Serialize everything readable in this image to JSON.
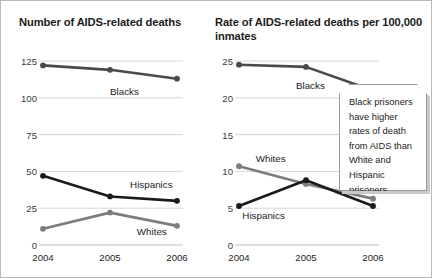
{
  "callout": {
    "text": "Black prisoners have higher rates of death from AIDS than White and Hispanic prisoners."
  },
  "chart_data": [
    {
      "type": "line",
      "panel": "left",
      "title": "Number of AIDS-related deaths",
      "xlabel": "",
      "ylabel": "",
      "categories": [
        "2004",
        "2005",
        "2006"
      ],
      "yticks": [
        "0",
        "25",
        "50",
        "75",
        "100",
        "125"
      ],
      "ylim": [
        0,
        125
      ],
      "grid": true,
      "legend_position": "inline-labels",
      "series": [
        {
          "name": "Blacks",
          "values": [
            122,
            119,
            113
          ],
          "color": "#4a4a4a",
          "label_x": 2005.0,
          "label_y": 104
        },
        {
          "name": "Hispanics",
          "values": [
            47,
            33,
            30
          ],
          "color": "#1a1a1a",
          "label_x": 2005.3,
          "label_y": 41
        },
        {
          "name": "Whites",
          "values": [
            11,
            22,
            13
          ],
          "color": "#7d7d7d",
          "label_x": 2005.4,
          "label_y": 9
        }
      ]
    },
    {
      "type": "line",
      "panel": "right",
      "title": "Rate of AIDS-related deaths per 100,000 inmates",
      "xlabel": "",
      "ylabel": "",
      "categories": [
        "2004",
        "2005",
        "2006"
      ],
      "yticks": [
        "0",
        "5",
        "10",
        "15",
        "20",
        "25"
      ],
      "ylim": [
        0,
        25
      ],
      "grid": true,
      "legend_position": "inline-labels",
      "series": [
        {
          "name": "Blacks",
          "values": [
            24.5,
            24.2,
            21.0
          ],
          "color": "#4a4a4a",
          "label_x": 2004.85,
          "label_y": 21.6
        },
        {
          "name": "Whites",
          "values": [
            10.7,
            8.3,
            6.3
          ],
          "color": "#7d7d7d",
          "label_x": 2004.25,
          "label_y": 11.7
        },
        {
          "name": "Hispanics",
          "values": [
            5.3,
            8.8,
            5.3
          ],
          "color": "#1a1a1a",
          "label_x": 2004.05,
          "label_y": 4.0
        }
      ]
    }
  ],
  "colors": {
    "frame": "#b9b9b9",
    "grid": "#d6d6d6",
    "axis": "#bdbdbd",
    "blacks": "#4a4a4a",
    "hispanics": "#1a1a1a",
    "whites": "#7d7d7d",
    "callout_border": "#9a9a9a",
    "callout_shadow": "#c9c9c9"
  }
}
